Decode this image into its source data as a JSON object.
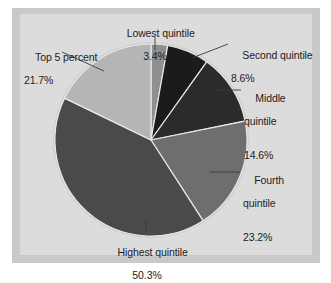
{
  "figure": {
    "panel_color": "#dcdcdc",
    "frame_color": "#c9c9c9",
    "background": "#ffffff",
    "text_color": "#1c1c1c"
  },
  "chart_data": {
    "type": "pie",
    "title": "",
    "subtitle": "",
    "xlabel": "",
    "ylabel": "",
    "grid": false,
    "legend_position": "none",
    "label_format": "name + percent",
    "total_percent": 121.8,
    "center": {
      "x": 151,
      "y": 140
    },
    "radius": 96,
    "start_angle_deg": -90,
    "direction": "clockwise",
    "categories": [
      "Lowest quintile",
      "Second quintile",
      "Middle quintile",
      "Fourth quintile",
      "Highest quintile",
      "Top 5 percent"
    ],
    "values": [
      3.4,
      8.6,
      14.6,
      23.2,
      50.3,
      21.7
    ],
    "value_labels": [
      "3.4%",
      "8.6%",
      "14.6%",
      "23.2%",
      "50.3%",
      "21.7%"
    ],
    "colors": [
      "#8f8f8f",
      "#1b1b1b",
      "#2b2b2b",
      "#6e6e6e",
      "#4a4a4a",
      "#b5b5b5"
    ],
    "slice_edge_color": "#e8e8e8",
    "slices": [
      {
        "name": "Lowest quintile",
        "value": 3.4,
        "label": "3.4%",
        "color": "#8f8f8f"
      },
      {
        "name": "Second quintile",
        "value": 8.6,
        "label": "8.6%",
        "color": "#1b1b1b"
      },
      {
        "name": "Middle quintile",
        "value": 14.6,
        "label": "14.6%",
        "color": "#2b2b2b"
      },
      {
        "name": "Fourth quintile",
        "value": 23.2,
        "label": "23.2%",
        "color": "#6e6e6e"
      },
      {
        "name": "Highest quintile",
        "value": 50.3,
        "label": "50.3%",
        "color": "#4a4a4a"
      },
      {
        "name": "Top 5 percent",
        "value": 21.7,
        "label": "21.7%",
        "color": "#b5b5b5"
      }
    ]
  },
  "labels": {
    "lowest": {
      "name": "Lowest quintile",
      "value": "3.4%"
    },
    "second": {
      "name": "Second quintile",
      "value": "8.6%"
    },
    "middle": {
      "name": "Middle",
      "name2": "quintile",
      "value": "14.6%"
    },
    "fourth": {
      "name": "Fourth",
      "name2": "quintile",
      "value": "23.2%"
    },
    "highest": {
      "name": "Highest quintile",
      "value": "50.3%"
    },
    "top5": {
      "name": "Top 5 percent",
      "value": "21.7%"
    }
  }
}
